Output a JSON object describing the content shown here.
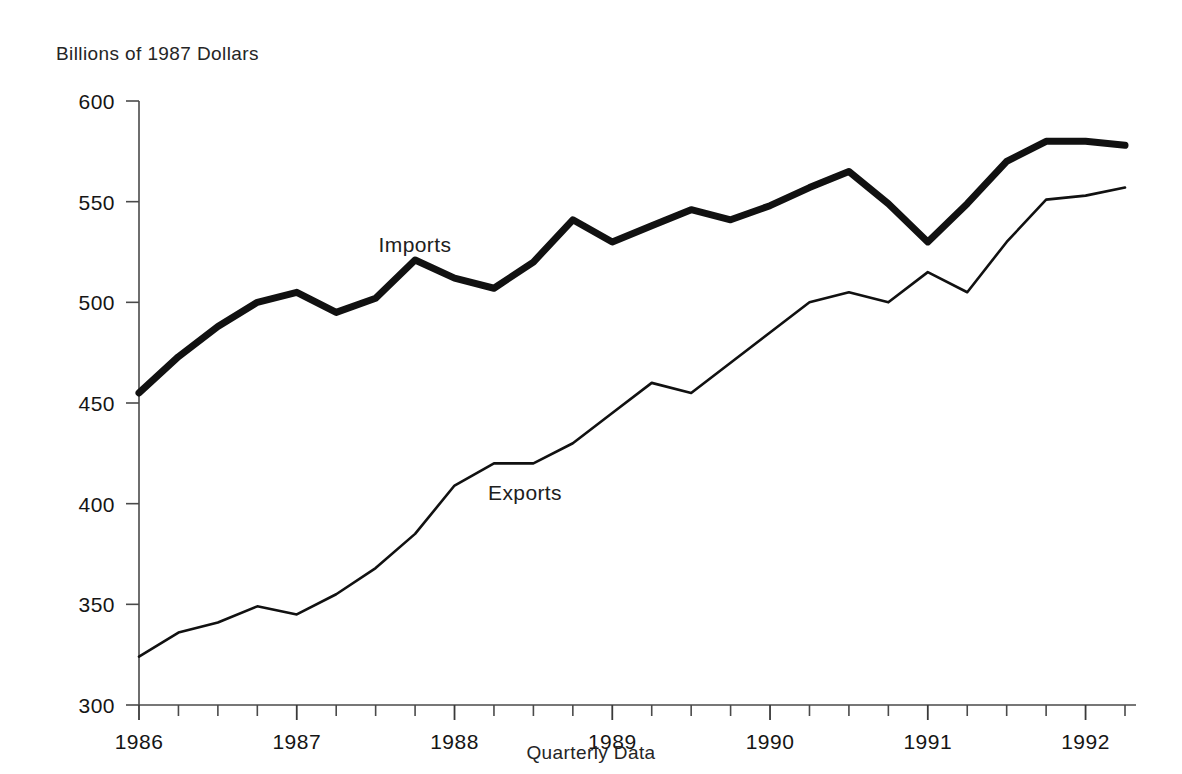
{
  "chart_data": {
    "type": "line",
    "title": "",
    "ylabel": "Billions of 1987 Dollars",
    "xlabel": "Quarterly Data",
    "ylim": [
      300,
      600
    ],
    "yticks": [
      300,
      350,
      400,
      450,
      500,
      550,
      600
    ],
    "ytick_labels": [
      "300",
      "350",
      "400",
      "450",
      "500",
      "550",
      "600"
    ],
    "xlim": [
      1986.0,
      1992.25
    ],
    "xticks": [
      1986,
      1987,
      1988,
      1989,
      1990,
      1991,
      1992
    ],
    "xtick_labels": [
      "1986",
      "1987",
      "1988",
      "1989",
      "1990",
      "1991",
      "1992"
    ],
    "x_minor_tick_interval_quarters": 1,
    "grid": false,
    "legend": "inline-annotations",
    "x": [
      "1986Q1",
      "1986Q2",
      "1986Q3",
      "1986Q4",
      "1987Q1",
      "1987Q2",
      "1987Q3",
      "1987Q4",
      "1988Q1",
      "1988Q2",
      "1988Q3",
      "1988Q4",
      "1989Q1",
      "1989Q2",
      "1989Q3",
      "1989Q4",
      "1990Q1",
      "1990Q2",
      "1990Q3",
      "1990Q4",
      "1991Q1",
      "1991Q2",
      "1991Q3",
      "1991Q4",
      "1992Q1",
      "1992Q2"
    ],
    "series": [
      {
        "name": "Imports",
        "color": "#111111",
        "line_width": 7,
        "label_position": {
          "x": 415,
          "y": 252
        },
        "values": [
          455,
          473,
          488,
          500,
          505,
          495,
          502,
          521,
          512,
          507,
          520,
          541,
          530,
          538,
          546,
          541,
          548,
          557,
          565,
          549,
          530,
          549,
          570,
          580,
          580,
          578
        ]
      },
      {
        "name": "Exports",
        "color": "#111111",
        "line_width": 2.6,
        "label_position": {
          "x": 525,
          "y": 500
        },
        "values": [
          324,
          336,
          341,
          349,
          345,
          355,
          368,
          385,
          409,
          420,
          420,
          430,
          445,
          460,
          455,
          470,
          485,
          500,
          505,
          500,
          515,
          505,
          530,
          551,
          553,
          557
        ]
      }
    ],
    "annotations": [
      {
        "text": "Imports",
        "series": "Imports"
      },
      {
        "text": "Exports",
        "series": "Exports"
      }
    ]
  },
  "plot_geometry": {
    "left_px": 139,
    "right_px": 1136,
    "top_px": 101,
    "bottom_px": 705,
    "quarter_step_px": 39.44
  }
}
